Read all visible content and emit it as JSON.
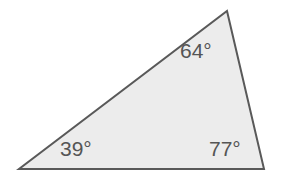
{
  "figure": {
    "name": "triangle-angle-diagram",
    "background_color": "#ffffff",
    "fill_color": "#ececec",
    "stroke_color": "#595959",
    "stroke_width": 2,
    "label_color": "#555555",
    "vertices": {
      "apex": [
        227,
        11
      ],
      "bottom_left": [
        19,
        169
      ],
      "bottom_right": [
        264,
        169
      ]
    },
    "labels": {
      "apex": "64°",
      "bottom_left": "39°",
      "bottom_right": "77°"
    }
  },
  "chart_data": {
    "type": "diagram",
    "title": "",
    "shape": "triangle",
    "angles": [
      {
        "vertex": "apex",
        "value": 64,
        "unit": "degrees",
        "label": "64°"
      },
      {
        "vertex": "bottom_left",
        "value": 39,
        "unit": "degrees",
        "label": "39°"
      },
      {
        "vertex": "bottom_right",
        "value": 77,
        "unit": "degrees",
        "label": "77°"
      }
    ],
    "angle_sum": 180
  }
}
